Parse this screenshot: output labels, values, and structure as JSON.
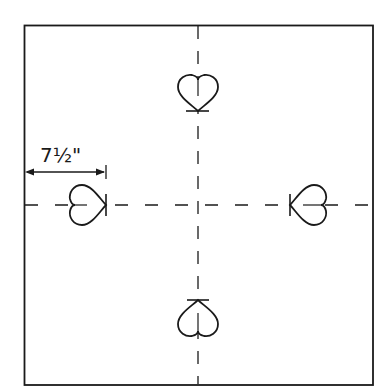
{
  "diagram": {
    "title": "",
    "dimension_label": "7½\"",
    "colors": {
      "stroke": "#1a1a1a",
      "background": "#ffffff"
    },
    "square": {
      "x": 24,
      "y": 25,
      "width": 349,
      "height": 360
    },
    "center": {
      "x": 198,
      "y": 205
    },
    "hearts": [
      {
        "position": "top",
        "tip_direction": "down"
      },
      {
        "position": "left",
        "tip_direction": "right"
      },
      {
        "position": "right",
        "tip_direction": "left"
      },
      {
        "position": "bottom",
        "tip_direction": "up"
      }
    ],
    "dimension": {
      "from_x": 25,
      "to_x": 106,
      "y": 172
    }
  }
}
